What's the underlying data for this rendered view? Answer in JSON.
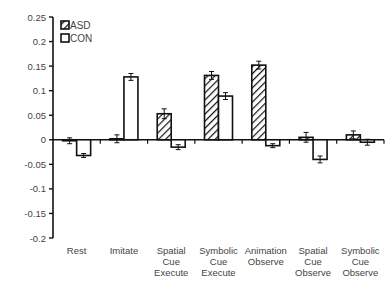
{
  "chart_data": {
    "type": "bar",
    "title": "",
    "xlabel": "",
    "ylabel": "",
    "ylim": [
      -0.2,
      0.25
    ],
    "yticks": [
      0.25,
      0.2,
      0.15,
      0.1,
      0.05,
      0,
      -0.05,
      -0.1,
      -0.15,
      -0.2
    ],
    "ytick_labels": [
      "0.25",
      "0.2",
      "0.15",
      "0.1",
      "0.05",
      "0",
      "-0.05",
      "-0.1",
      "-0.15",
      "-0.2"
    ],
    "grid": false,
    "legend_position": "top-left",
    "categories": [
      [
        "Rest"
      ],
      [
        "Imitate"
      ],
      [
        "Spatial",
        "Cue",
        "Execute"
      ],
      [
        "Symbolic",
        "Cue",
        "Execute"
      ],
      [
        "Animation",
        "Observe"
      ],
      [
        "Spatial",
        "Cue",
        "Observe"
      ],
      [
        "Symbolic",
        "Cue",
        "Observe"
      ]
    ],
    "series": [
      {
        "name": "ASD",
        "pattern": "hatched",
        "values": [
          -0.002,
          0.002,
          0.053,
          0.131,
          0.152,
          0.005,
          0.01
        ],
        "errors": [
          0.006,
          0.008,
          0.01,
          0.008,
          0.008,
          0.01,
          0.008
        ]
      },
      {
        "name": "CON",
        "pattern": "open",
        "values": [
          -0.032,
          0.128,
          -0.015,
          0.089,
          -0.012,
          -0.04,
          -0.005
        ],
        "errors": [
          0.004,
          0.007,
          0.005,
          0.007,
          0.004,
          0.007,
          0.006
        ]
      }
    ]
  },
  "legend": {
    "asd_label": "ASD",
    "con_label": "CON"
  }
}
